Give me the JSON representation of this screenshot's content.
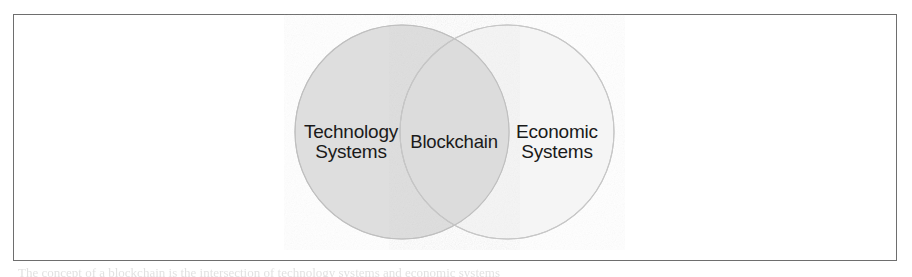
{
  "figure": {
    "type": "venn-diagram",
    "sets": [
      {
        "id": "left",
        "label_line1": "Technology",
        "label_line2": "Systems",
        "fill": "#dedede",
        "stroke": "#c2c2c2"
      },
      {
        "id": "right",
        "label_line1": "Economic",
        "label_line2": "Systems",
        "fill": "#f5f5f5",
        "stroke": "#c2c2c2"
      }
    ],
    "intersection": {
      "id": "overlap",
      "label": "Blockchain",
      "fill": "#dcdcdc",
      "stroke": "#bdbdbd"
    },
    "frame": {
      "border_color": "#6e6e6e",
      "background": "#ffffff"
    },
    "caption_ghost": "The concept of a blockchain is the intersection of technology systems and economic systems"
  }
}
